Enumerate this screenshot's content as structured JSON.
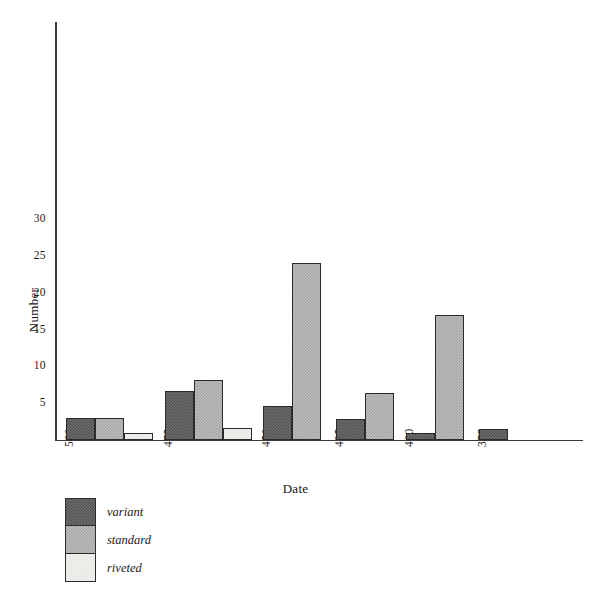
{
  "chart_data": {
    "type": "bar",
    "title": "",
    "xlabel": "Date",
    "ylabel": "Number",
    "categories": [
      "500",
      "475",
      "450",
      "425",
      "400",
      "375"
    ],
    "series": [
      {
        "name": "variant",
        "values": [
          3,
          6.7,
          4.6,
          2.8,
          1,
          1.5
        ]
      },
      {
        "name": "standard",
        "values": [
          3,
          8.1,
          24.1,
          6.4,
          17,
          0
        ]
      },
      {
        "name": "riveted",
        "values": [
          1,
          1.6,
          0,
          0,
          0,
          0
        ]
      }
    ],
    "ylim": [
      0,
      34
    ],
    "yticks": [
      5,
      10,
      15,
      20,
      25,
      30
    ],
    "xticks": [
      "500",
      "475",
      "450",
      "425",
      "400",
      "375"
    ],
    "grid": false,
    "legend_position": "below-left",
    "colors": {
      "variant": "#6f6f6f",
      "standard": "#bdbdbd",
      "riveted": "#f1f1ef",
      "outline": "#2b2b2b",
      "axis": "#3a3a3a",
      "background": "#ffffff"
    }
  },
  "axes": {
    "y_title": "Number",
    "x_title": "Date"
  },
  "legend": {
    "items": [
      {
        "label": "variant"
      },
      {
        "label": "standard"
      },
      {
        "label": "riveted"
      }
    ]
  }
}
